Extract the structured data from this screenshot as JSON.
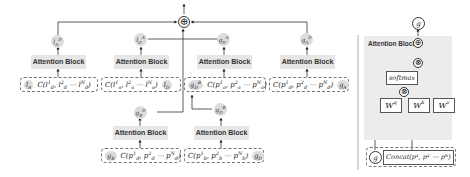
{
  "main_diagram": {
    "attention_block_label": "Attention Block",
    "top_nodes": [
      {
        "id": "lA_D",
        "base": "l",
        "sub": "A",
        "sup": "D"
      },
      {
        "id": "lD_A",
        "base": "l",
        "sub": "D",
        "sup": "A"
      },
      {
        "id": "gD_A",
        "base": "g",
        "sub": "D",
        "sup": "A"
      },
      {
        "id": "gA_D",
        "base": "g",
        "sub": "A",
        "sup": "D"
      }
    ],
    "upper_inputs": [
      {
        "token": "l_A",
        "concat": "C(l¹_d, l²_d ⋯ l^N_d)",
        "token_position": "left"
      },
      {
        "concat": "C(l¹_a, l²_a ⋯ l^N_a)",
        "token": "l_D",
        "token_position": "right"
      },
      {
        "token": "g^B_D",
        "concat": "C(p¹_a, p²_a ⋯ p^N_a)",
        "token_position": "left"
      },
      {
        "concat": "C(p¹_d, p²_d ⋯ p^N_d)",
        "token": "g_A",
        "token_position": "right"
      }
    ],
    "mid_nodes": [
      {
        "id": "gB_D",
        "base": "g",
        "sub": "B",
        "sup": "D"
      },
      {
        "id": "gD_B",
        "base": "g",
        "sub": "D",
        "sup": "B"
      }
    ],
    "lower_inputs": [
      {
        "token": "g_B",
        "concat": "C(p¹_d, p²_d ⋯ p^N_d)",
        "token_position": "left"
      },
      {
        "concat": "C(p¹_b, p²_b ⋯ p^N_b)",
        "token": "g_D",
        "token_position": "right"
      }
    ],
    "sum_symbol": "⊕"
  },
  "detail_panel": {
    "title": "Attention Block",
    "output": "g",
    "softmax_label": "softmax",
    "weights": [
      {
        "base": "W",
        "sup": "q"
      },
      {
        "base": "W",
        "sup": "k"
      },
      {
        "base": "W",
        "sup": "v"
      }
    ],
    "input_token": "g",
    "concat_label": "Concat(p¹, p² ⋯ pᴺ)",
    "add_symbol": "⊕",
    "mul_symbol": "⊗"
  }
}
